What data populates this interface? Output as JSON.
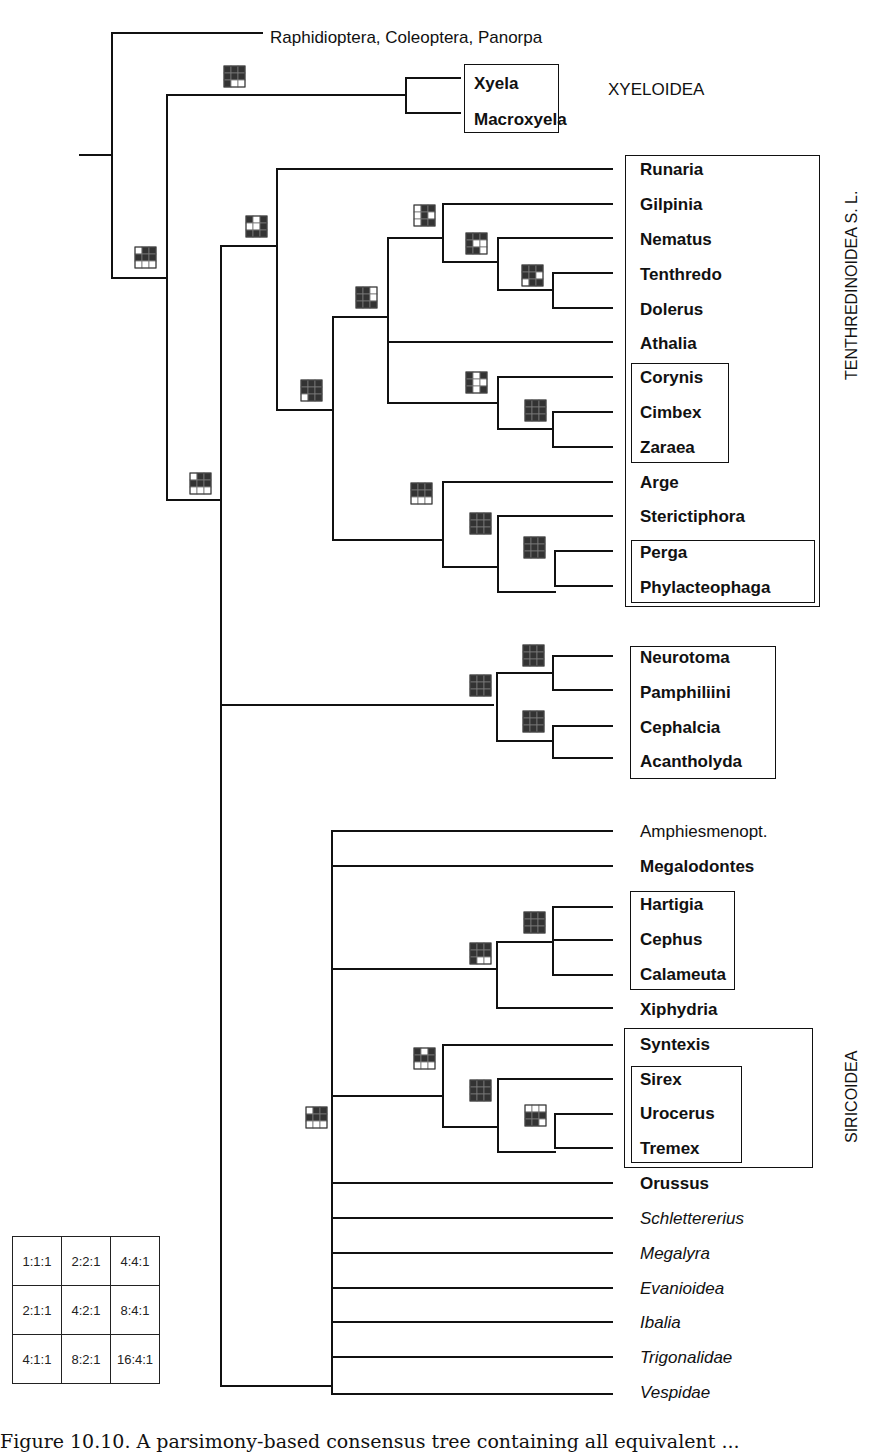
{
  "figure": {
    "caption_visible": "Figure 10.10. A parsimony-based consensus tree containing all equivalent ...",
    "line_color": "#111111",
    "node_dark_color": "#333333",
    "node_light_color": "#ffffff"
  },
  "taxa": [
    {
      "id": "raphid",
      "label": "Raphidioptera, Coleoptera, Panorpa",
      "style": "regular",
      "x": 270,
      "y": 38
    },
    {
      "id": "xyela",
      "label": "Xyela",
      "style": "bold",
      "x": 474,
      "y": 84
    },
    {
      "id": "macroxyela",
      "label": "Macroxyela",
      "style": "bold",
      "x": 474,
      "y": 120
    },
    {
      "id": "runaria",
      "label": "Runaria",
      "style": "bold",
      "x": 640,
      "y": 170
    },
    {
      "id": "gilpinia",
      "label": "Gilpinia",
      "style": "bold",
      "x": 640,
      "y": 205
    },
    {
      "id": "nematus",
      "label": "Nematus",
      "style": "bold",
      "x": 640,
      "y": 240
    },
    {
      "id": "tenthredo",
      "label": "Tenthredo",
      "style": "bold",
      "x": 640,
      "y": 275
    },
    {
      "id": "dolerus",
      "label": "Dolerus",
      "style": "bold",
      "x": 640,
      "y": 310
    },
    {
      "id": "athalia",
      "label": "Athalia",
      "style": "bold",
      "x": 640,
      "y": 344
    },
    {
      "id": "corynis",
      "label": "Corynis",
      "style": "bold",
      "x": 640,
      "y": 378
    },
    {
      "id": "cimbex",
      "label": "Cimbex",
      "style": "bold",
      "x": 640,
      "y": 413
    },
    {
      "id": "zaraea",
      "label": "Zaraea",
      "style": "bold",
      "x": 640,
      "y": 448
    },
    {
      "id": "arge",
      "label": "Arge",
      "style": "bold",
      "x": 640,
      "y": 483
    },
    {
      "id": "sterictiphora",
      "label": "Sterictiphora",
      "style": "bold",
      "x": 640,
      "y": 517
    },
    {
      "id": "perga",
      "label": "Perga",
      "style": "bold",
      "x": 640,
      "y": 553
    },
    {
      "id": "phylacteophaga",
      "label": "Phylacteophaga",
      "style": "bold",
      "x": 640,
      "y": 588
    },
    {
      "id": "neurotoma",
      "label": "Neurotoma",
      "style": "bold",
      "x": 640,
      "y": 658
    },
    {
      "id": "pamphiliini",
      "label": "Pamphiliini",
      "style": "bold",
      "x": 640,
      "y": 693
    },
    {
      "id": "cephalcia",
      "label": "Cephalcia",
      "style": "bold",
      "x": 640,
      "y": 728
    },
    {
      "id": "acantholyda",
      "label": "Acantholyda",
      "style": "bold",
      "x": 640,
      "y": 762
    },
    {
      "id": "amphiesmenopt",
      "label": "Amphiesmenopt.",
      "style": "regular",
      "x": 640,
      "y": 832
    },
    {
      "id": "megalodontes",
      "label": "Megalodontes",
      "style": "bold",
      "x": 640,
      "y": 867
    },
    {
      "id": "hartigia",
      "label": "Hartigia",
      "style": "bold",
      "x": 640,
      "y": 905
    },
    {
      "id": "cephus",
      "label": "Cephus",
      "style": "bold",
      "x": 640,
      "y": 940
    },
    {
      "id": "calameuta",
      "label": "Calameuta",
      "style": "bold",
      "x": 640,
      "y": 975
    },
    {
      "id": "xiphydria",
      "label": "Xiphydria",
      "style": "bold",
      "x": 640,
      "y": 1010
    },
    {
      "id": "syntexis",
      "label": "Syntexis",
      "style": "bold",
      "x": 640,
      "y": 1045
    },
    {
      "id": "sirex",
      "label": "Sirex",
      "style": "bold",
      "x": 640,
      "y": 1080
    },
    {
      "id": "urocerus",
      "label": "Urocerus",
      "style": "bold",
      "x": 640,
      "y": 1114
    },
    {
      "id": "tremex",
      "label": "Tremex",
      "style": "bold",
      "x": 640,
      "y": 1149
    },
    {
      "id": "orussus",
      "label": "Orussus",
      "style": "bold",
      "x": 640,
      "y": 1184
    },
    {
      "id": "schlettererius",
      "label": "Schlettererius",
      "style": "italic",
      "x": 640,
      "y": 1219
    },
    {
      "id": "megalyra",
      "label": "Megalyra",
      "style": "italic",
      "x": 640,
      "y": 1254
    },
    {
      "id": "evanioidea",
      "label": "Evanioidea",
      "style": "italic",
      "x": 640,
      "y": 1289
    },
    {
      "id": "ibalia",
      "label": "Ibalia",
      "style": "italic",
      "x": 640,
      "y": 1323
    },
    {
      "id": "trigonalidae",
      "label": "Trigonalidae",
      "style": "italic",
      "x": 640,
      "y": 1358
    },
    {
      "id": "vespidae",
      "label": "Vespidae",
      "style": "italic",
      "x": 640,
      "y": 1393
    }
  ],
  "clade_labels": [
    {
      "id": "xyeloidea",
      "label": "XYELOIDEA",
      "x": 608,
      "y": 90,
      "vertical": false
    },
    {
      "id": "tenthredinoidea",
      "label": "TENTHREDINOIDEA S. L.",
      "x": 843,
      "y": 380,
      "vertical": true
    },
    {
      "id": "siricoidea",
      "label": "SIRICOIDEA",
      "x": 843,
      "y": 1143,
      "vertical": true
    }
  ],
  "boxes": [
    {
      "id": "box-xyeloidea",
      "x": 464,
      "y": 64,
      "w": 95,
      "h": 69
    },
    {
      "id": "box-tenthredinoidea",
      "x": 625,
      "y": 155,
      "w": 195,
      "h": 452
    },
    {
      "id": "box-cimbicidae",
      "x": 631,
      "y": 363,
      "w": 98,
      "h": 100
    },
    {
      "id": "box-pergidae",
      "x": 631,
      "y": 540,
      "w": 184,
      "h": 63
    },
    {
      "id": "box-pamphilioidea",
      "x": 630,
      "y": 646,
      "w": 146,
      "h": 133
    },
    {
      "id": "box-cephidae",
      "x": 630,
      "y": 891,
      "w": 105,
      "h": 99
    },
    {
      "id": "box-siricoidea",
      "x": 624,
      "y": 1028,
      "w": 189,
      "h": 140
    },
    {
      "id": "box-siricidae",
      "x": 631,
      "y": 1066,
      "w": 111,
      "h": 97
    }
  ],
  "nodes": [
    {
      "id": "n-root-hym",
      "x": 135,
      "y": 247,
      "cells": [
        0,
        1,
        1,
        1,
        1,
        1,
        0,
        0,
        0
      ]
    },
    {
      "id": "n-xyeloidea",
      "x": 224,
      "y": 66,
      "cells": [
        1,
        1,
        1,
        1,
        1,
        1,
        1,
        0,
        0
      ]
    },
    {
      "id": "n-nonxyelid",
      "x": 190,
      "y": 473,
      "cells": [
        0,
        1,
        1,
        1,
        1,
        1,
        0,
        0,
        0
      ]
    },
    {
      "id": "n-tenth-all",
      "x": 246,
      "y": 216,
      "cells": [
        1,
        0,
        1,
        0,
        0,
        1,
        1,
        1,
        1
      ]
    },
    {
      "id": "n-tenth-core",
      "x": 301,
      "y": 380,
      "cells": [
        1,
        1,
        1,
        1,
        1,
        1,
        0,
        1,
        1
      ]
    },
    {
      "id": "n-tenth-sub",
      "x": 356,
      "y": 287,
      "cells": [
        1,
        1,
        0,
        1,
        1,
        0,
        1,
        1,
        1
      ]
    },
    {
      "id": "n-gilpinia-grp",
      "x": 414,
      "y": 205,
      "cells": [
        0,
        1,
        1,
        0,
        1,
        0,
        0,
        1,
        1
      ]
    },
    {
      "id": "n-nematus-grp",
      "x": 466,
      "y": 233,
      "cells": [
        1,
        1,
        1,
        1,
        0,
        0,
        1,
        1,
        0
      ]
    },
    {
      "id": "n-tenthredo-grp",
      "x": 522,
      "y": 265,
      "cells": [
        1,
        1,
        1,
        1,
        1,
        0,
        0,
        1,
        1
      ]
    },
    {
      "id": "n-cimbicid",
      "x": 466,
      "y": 372,
      "cells": [
        1,
        0,
        1,
        1,
        0,
        0,
        1,
        0,
        1
      ]
    },
    {
      "id": "n-cimbex-zaraea",
      "x": 525,
      "y": 400,
      "cells": [
        1,
        1,
        1,
        1,
        1,
        1,
        1,
        1,
        1
      ]
    },
    {
      "id": "n-argid-perg",
      "x": 411,
      "y": 483,
      "cells": [
        1,
        1,
        1,
        1,
        1,
        1,
        0,
        0,
        0
      ]
    },
    {
      "id": "n-stericti-perg",
      "x": 470,
      "y": 513,
      "cells": [
        1,
        1,
        1,
        1,
        1,
        1,
        1,
        1,
        1
      ]
    },
    {
      "id": "n-pergid",
      "x": 524,
      "y": 537,
      "cells": [
        1,
        1,
        1,
        1,
        1,
        1,
        1,
        1,
        1
      ]
    },
    {
      "id": "n-pamphilioid",
      "x": 470,
      "y": 675,
      "cells": [
        1,
        1,
        1,
        1,
        1,
        1,
        1,
        1,
        1
      ]
    },
    {
      "id": "n-pamphiliid",
      "x": 523,
      "y": 645,
      "cells": [
        1,
        1,
        1,
        1,
        1,
        1,
        1,
        1,
        1
      ]
    },
    {
      "id": "n-cephalcia",
      "x": 523,
      "y": 711,
      "cells": [
        1,
        1,
        1,
        1,
        1,
        1,
        1,
        1,
        1
      ]
    },
    {
      "id": "n-unipyr",
      "x": 306,
      "y": 1107,
      "cells": [
        0,
        1,
        1,
        1,
        1,
        1,
        0,
        0,
        0
      ]
    },
    {
      "id": "n-cephid-xiph",
      "x": 470,
      "y": 943,
      "cells": [
        1,
        1,
        1,
        1,
        1,
        1,
        1,
        0,
        0
      ]
    },
    {
      "id": "n-cephid",
      "x": 524,
      "y": 912,
      "cells": [
        1,
        1,
        1,
        1,
        1,
        1,
        1,
        1,
        1
      ]
    },
    {
      "id": "n-siricoid",
      "x": 414,
      "y": 1048,
      "cells": [
        1,
        0,
        1,
        1,
        1,
        1,
        0,
        0,
        0
      ]
    },
    {
      "id": "n-sirex-grp",
      "x": 470,
      "y": 1080,
      "cells": [
        1,
        1,
        1,
        1,
        1,
        1,
        1,
        1,
        1
      ]
    },
    {
      "id": "n-urocerus-grp",
      "x": 525,
      "y": 1105,
      "cells": [
        0,
        0,
        0,
        1,
        1,
        1,
        1,
        1,
        0
      ]
    }
  ],
  "legend": {
    "rows": [
      [
        "1:1:1",
        "2:2:1",
        "4:4:1"
      ],
      [
        "2:1:1",
        "4:2:1",
        "8:4:1"
      ],
      [
        "4:1:1",
        "8:2:1",
        "16:4:1"
      ]
    ]
  }
}
